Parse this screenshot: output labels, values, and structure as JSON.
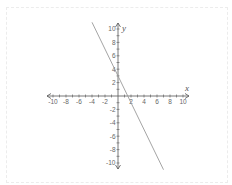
{
  "chart_data": {
    "type": "line",
    "title": "",
    "xlabel": "x",
    "ylabel": "y",
    "xlim": [
      -10,
      10
    ],
    "ylim": [
      -10,
      10
    ],
    "x_ticks": [
      -10,
      -8,
      -6,
      -4,
      -2,
      2,
      4,
      6,
      8,
      10
    ],
    "y_ticks": [
      10,
      8,
      6,
      4,
      2,
      -2,
      -4,
      -6,
      -8,
      -10
    ],
    "grid": false,
    "legend": null,
    "series": [
      {
        "name": "y = -2x + 3",
        "slope": -2,
        "intercept": 3,
        "x": [
          -4,
          7
        ],
        "y": [
          11,
          -11
        ]
      }
    ]
  },
  "colors": {
    "axis": "#555555",
    "line": "#9a9a9a",
    "labels": "#666666"
  }
}
